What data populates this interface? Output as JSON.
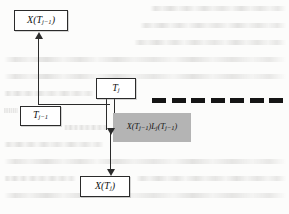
{
  "diagram": {
    "nodes": {
      "x_prev": {
        "label": "X(T",
        "sub": "j−1",
        "tail": ")",
        "full": "X(Tⱼ₋₁)"
      },
      "t_prev": {
        "label": "T",
        "sub": "j−1",
        "tail": "",
        "full": "Tⱼ₋₁"
      },
      "t_j": {
        "label": "T",
        "sub": "j",
        "tail": "",
        "full": "Tⱼ"
      },
      "x_j": {
        "label": "X(T",
        "sub": "j",
        "tail": ")",
        "full": "X(Tⱼ)"
      }
    },
    "expression": {
      "part1": "X(T",
      "sub1": "j−1",
      "part2": ")L",
      "sub2": "j",
      "part3": "(T",
      "sub3": "j−1",
      "part4": ")",
      "full": "X(Tⱼ₋₁)Lⱼ(Tⱼ₋₁)",
      "fill_color": "#b4b4b4"
    },
    "dashed_rule": {
      "dash_count": 7,
      "color": "#151515"
    },
    "connectors": [
      {
        "name": "t-prev-to-x-prev",
        "style": "solid-thin",
        "direction": "up"
      },
      {
        "name": "t-prev-to-t-j",
        "style": "solid-thin",
        "direction": "right"
      },
      {
        "name": "t-j-to-expression",
        "style": "double-stroke",
        "direction": "down"
      },
      {
        "name": "expression-to-x-j",
        "style": "solid-thin",
        "direction": "down"
      }
    ],
    "ink_color": "#2b2b2b",
    "paper_color": "#fcfcfb"
  }
}
